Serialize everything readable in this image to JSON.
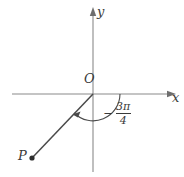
{
  "figure": {
    "type": "coordinate-plane-angle-diagram",
    "axes": {
      "x_label": "x",
      "y_label": "y",
      "origin_label": "O",
      "axis_color": "#8a8a8a"
    },
    "points": [
      {
        "name": "P",
        "label": "P",
        "quadrant": "third",
        "x": -1,
        "y": -1
      }
    ],
    "ray": {
      "from": "O",
      "to": "P",
      "color": "#3a3a3a"
    },
    "angle": {
      "value_text": "3π",
      "sign_text": "−",
      "denominator_text": "4",
      "full_text": "−3π/4",
      "radians": -2.356194490192345,
      "degrees": -135,
      "direction": "clockwise",
      "from_axis": "positive-x-axis",
      "arc_color": "#3a3a3a"
    }
  }
}
